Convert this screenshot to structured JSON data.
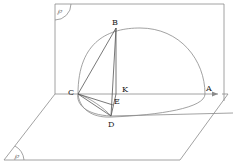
{
  "diagram": {
    "title": "",
    "planes": [
      {
        "name": "β",
        "symbol": "℘",
        "orientation": "vertical"
      },
      {
        "name": "α",
        "symbol": "℘",
        "orientation": "horizontal"
      }
    ],
    "points": {
      "A": "A",
      "B": "B",
      "C": "C",
      "D": "D",
      "E": "E",
      "K": "K"
    },
    "plane_labels": {
      "vertical": "℘",
      "horizontal": "℘"
    },
    "colors": {
      "line": "#8a8a8a",
      "text": "#222222",
      "background": "#ffffff"
    }
  }
}
